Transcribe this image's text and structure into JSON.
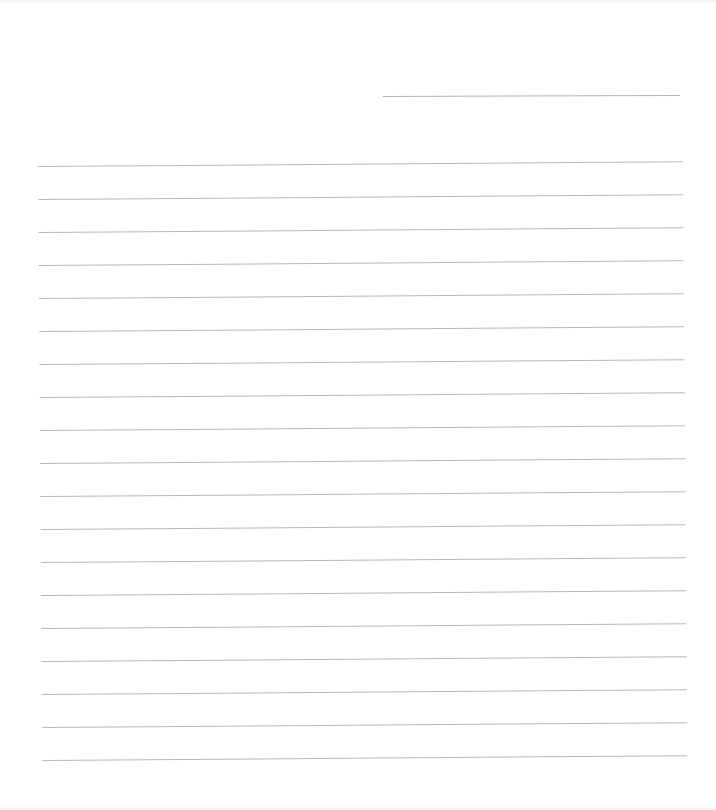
{
  "document": {
    "type": "lined-paper",
    "header_line": {
      "label": ""
    },
    "ruled_line_count": 19,
    "colors": {
      "paper": "#ffffff",
      "rule": "#b8b8b8"
    },
    "rules": [
      {
        "text": ""
      },
      {
        "text": ""
      },
      {
        "text": ""
      },
      {
        "text": ""
      },
      {
        "text": ""
      },
      {
        "text": ""
      },
      {
        "text": ""
      },
      {
        "text": ""
      },
      {
        "text": ""
      },
      {
        "text": ""
      },
      {
        "text": ""
      },
      {
        "text": ""
      },
      {
        "text": ""
      },
      {
        "text": ""
      },
      {
        "text": ""
      },
      {
        "text": ""
      },
      {
        "text": ""
      },
      {
        "text": ""
      },
      {
        "text": ""
      }
    ]
  }
}
